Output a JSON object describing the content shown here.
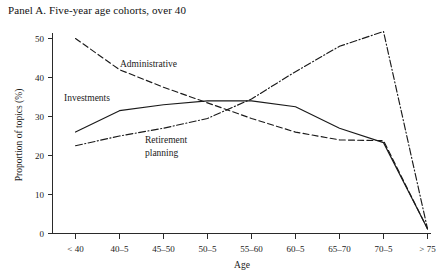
{
  "panel": {
    "title": "Panel A. Five-year age cohorts, over 40"
  },
  "chart_data": {
    "type": "line",
    "title": "Panel A. Five-year age cohorts, over 40",
    "xlabel": "Age",
    "ylabel": "Proportion of topics (%)",
    "categories": [
      "< 40",
      "40–5",
      "45–50",
      "50–5",
      "55–60",
      "60–5",
      "65–70",
      "70–5",
      "> 75"
    ],
    "xticklabels": [
      "< 40",
      "40–5",
      "45–50",
      "50–5",
      "55–60",
      "60–5",
      "65–70",
      "70–5",
      "> 75"
    ],
    "yticklabels": [
      "0",
      "10",
      "20",
      "30",
      "40",
      "50"
    ],
    "yticks": [
      0,
      10,
      20,
      30,
      40,
      50
    ],
    "ylim": [
      0,
      52
    ],
    "grid": false,
    "legend": "inline-annotations",
    "series": [
      {
        "name": "Administrative",
        "style": "dashed",
        "color": "#1a1a1a",
        "values": [
          50.0,
          42.0,
          37.5,
          33.5,
          29.5,
          26.0,
          24.0,
          23.8,
          1.2
        ]
      },
      {
        "name": "Investments",
        "style": "solid",
        "color": "#1a1a1a",
        "values": [
          26.0,
          31.5,
          33.0,
          34.0,
          34.0,
          32.5,
          27.0,
          23.3,
          1.2
        ]
      },
      {
        "name": "Retirement planning",
        "style": "dash-dot",
        "color": "#1a1a1a",
        "values": [
          22.5,
          25.0,
          27.0,
          29.5,
          34.5,
          41.5,
          48.0,
          51.8,
          1.2
        ]
      }
    ],
    "annotations": [
      {
        "text": "Administrative",
        "series": "Administrative"
      },
      {
        "text": "Investments",
        "series": "Investments"
      },
      {
        "text": "Retirement",
        "series": "Retirement planning"
      },
      {
        "text": "planning",
        "series": "Retirement planning"
      }
    ]
  }
}
